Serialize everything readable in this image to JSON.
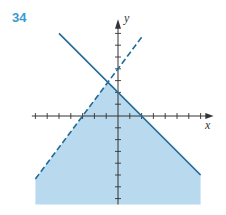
{
  "problem_number": "34",
  "colors": {
    "fill": "#b9daee",
    "line": "#1f6a99",
    "axis": "#333333",
    "label": "#3a9ad0"
  },
  "chart_data": {
    "type": "inequality-graph",
    "title": "",
    "xlabel": "x",
    "ylabel": "y",
    "xlim": [
      -7,
      7
    ],
    "ylim": [
      -7,
      7
    ],
    "x_ticks": [
      -7,
      -6,
      -5,
      -4,
      -3,
      -2,
      -1,
      1,
      2,
      3,
      4,
      5,
      6,
      7
    ],
    "y_ticks": [
      -7,
      -6,
      -5,
      -4,
      -3,
      -2,
      -1,
      1,
      2,
      3,
      4,
      5,
      6,
      7
    ],
    "tick_labels_shown": false,
    "grid": false,
    "lines": [
      {
        "name": "solid",
        "style": "solid",
        "equation": "y = -x + 2",
        "slope": -1,
        "intercept": 2,
        "x_range": [
          -5,
          7
        ]
      },
      {
        "name": "dashed",
        "style": "dashed",
        "equation": "y = (4/3)x + 4",
        "slope": 1.3333,
        "intercept": 4,
        "x_range": [
          -7,
          2.1
        ]
      }
    ],
    "shaded_region": {
      "description": "below both lines",
      "inequalities": [
        "y <= -x + 2",
        "y < (4/3)x + 4"
      ],
      "vertex": [
        -0.857,
        2.857
      ]
    }
  }
}
